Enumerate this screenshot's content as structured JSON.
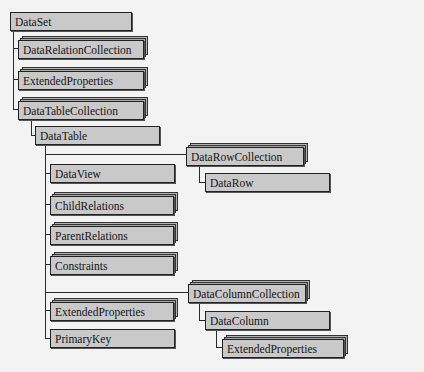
{
  "diagram": {
    "type": "object-model-hierarchy",
    "nodes": {
      "dataset": {
        "label": "DataSet",
        "kind": "object"
      },
      "data_relation_collection": {
        "label": "DataRelationCollection",
        "kind": "collection"
      },
      "dataset_extended_properties": {
        "label": "ExtendedProperties",
        "kind": "collection"
      },
      "data_table_collection": {
        "label": "DataTableCollection",
        "kind": "collection"
      },
      "data_table": {
        "label": "DataTable",
        "kind": "object"
      },
      "data_row_collection": {
        "label": "DataRowCollection",
        "kind": "collection"
      },
      "data_row": {
        "label": "DataRow",
        "kind": "object"
      },
      "data_view": {
        "label": "DataView",
        "kind": "object"
      },
      "child_relations": {
        "label": "ChildRelations",
        "kind": "collection"
      },
      "parent_relations": {
        "label": "ParentRelations",
        "kind": "collection"
      },
      "constraints": {
        "label": "Constraints",
        "kind": "collection"
      },
      "data_column_collection": {
        "label": "DataColumnCollection",
        "kind": "collection"
      },
      "table_extended_properties": {
        "label": "ExtendedProperties",
        "kind": "collection"
      },
      "data_column": {
        "label": "DataColumn",
        "kind": "object"
      },
      "primary_key": {
        "label": "PrimaryKey",
        "kind": "object"
      },
      "column_extended_properties": {
        "label": "ExtendedProperties",
        "kind": "collection"
      }
    },
    "edges": [
      [
        "DataSet",
        "DataRelationCollection"
      ],
      [
        "DataSet",
        "ExtendedProperties"
      ],
      [
        "DataSet",
        "DataTableCollection"
      ],
      [
        "DataTableCollection",
        "DataTable"
      ],
      [
        "DataTable",
        "DataRowCollection"
      ],
      [
        "DataRowCollection",
        "DataRow"
      ],
      [
        "DataTable",
        "DataView"
      ],
      [
        "DataTable",
        "ChildRelations"
      ],
      [
        "DataTable",
        "ParentRelations"
      ],
      [
        "DataTable",
        "Constraints"
      ],
      [
        "DataTable",
        "DataColumnCollection"
      ],
      [
        "DataColumnCollection",
        "DataColumn"
      ],
      [
        "DataColumn",
        "ExtendedProperties"
      ],
      [
        "DataTable",
        "ExtendedProperties"
      ],
      [
        "DataTable",
        "PrimaryKey"
      ]
    ],
    "colors": {
      "background": "#f3f3f3",
      "box_fill": "#c9c9c9",
      "box_border": "#222222",
      "line": "#2a2a2a"
    }
  }
}
